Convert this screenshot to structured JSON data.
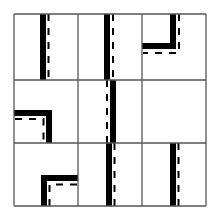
{
  "diagram": {
    "type": "3x3 visual pattern puzzle grid",
    "canvas": {
      "width": 222,
      "height": 222
    },
    "grid": {
      "rows": 3,
      "cols": 3,
      "x_lines": [
        14,
        78,
        142,
        206
      ],
      "y_lines": [
        14,
        80,
        143,
        206
      ],
      "line_color": "#555555",
      "line_width": 1.3
    },
    "colors": {
      "solid": "#000000",
      "dashed": "#000000",
      "background": "#ffffff"
    },
    "cells": [
      {
        "row": 0,
        "col": 0,
        "name": "cell-r1-c1",
        "shape": "vertical-bar",
        "solid_rects": [
          {
            "x": 40,
            "y": 14,
            "w": 6,
            "h": 66
          }
        ],
        "dashed_paths": [
          "M48.5 14 L48.5 80"
        ]
      },
      {
        "row": 0,
        "col": 1,
        "name": "cell-r1-c2",
        "shape": "vertical-bar",
        "solid_rects": [
          {
            "x": 104,
            "y": 14,
            "w": 6,
            "h": 66
          }
        ],
        "dashed_paths": [
          "M113 14 L113 80"
        ]
      },
      {
        "row": 0,
        "col": 2,
        "name": "cell-r1-c3",
        "shape": "L-corner",
        "solid_rects": [
          {
            "x": 170,
            "y": 14,
            "w": 6,
            "h": 35
          },
          {
            "x": 142,
            "y": 43,
            "w": 34,
            "h": 6
          }
        ],
        "dashed_paths": [
          "M179 14 L179 53 L143 53"
        ]
      },
      {
        "row": 1,
        "col": 0,
        "name": "cell-r2-c1",
        "shape": "L-corner",
        "solid_rects": [
          {
            "x": 14,
            "y": 110,
            "w": 38,
            "h": 6
          },
          {
            "x": 46,
            "y": 110,
            "w": 6,
            "h": 33
          }
        ],
        "dashed_paths": [
          "M15 119 L43.5 119 L43.5 143"
        ]
      },
      {
        "row": 1,
        "col": 1,
        "name": "cell-r2-c2",
        "shape": "vertical-bar",
        "solid_rects": [
          {
            "x": 110,
            "y": 80,
            "w": 6,
            "h": 63
          }
        ],
        "dashed_paths": [
          "M107 80 L107 143"
        ]
      },
      {
        "row": 1,
        "col": 2,
        "name": "cell-r2-c3",
        "shape": "empty",
        "solid_rects": [],
        "dashed_paths": []
      },
      {
        "row": 2,
        "col": 0,
        "name": "cell-r3-c1",
        "shape": "L-corner",
        "solid_rects": [
          {
            "x": 41,
            "y": 175,
            "w": 37,
            "h": 6
          },
          {
            "x": 41,
            "y": 175,
            "w": 6,
            "h": 31
          }
        ],
        "dashed_paths": [
          "M49.5 206 L49.5 184.5 L78 184.5"
        ]
      },
      {
        "row": 2,
        "col": 1,
        "name": "cell-r3-c2",
        "shape": "vertical-bar",
        "solid_rects": [
          {
            "x": 106,
            "y": 143,
            "w": 6,
            "h": 63
          }
        ],
        "dashed_paths": [
          "M114.5 143 L114.5 206"
        ]
      },
      {
        "row": 2,
        "col": 2,
        "name": "cell-r3-c3",
        "shape": "vertical-bar",
        "solid_rects": [
          {
            "x": 170,
            "y": 143,
            "w": 6,
            "h": 63
          }
        ],
        "dashed_paths": [
          "M178.5 143 L178.5 206"
        ]
      }
    ],
    "dash_pattern": "7 7",
    "dash_width": 2
  }
}
